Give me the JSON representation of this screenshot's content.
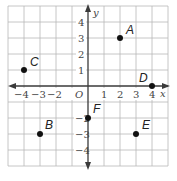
{
  "figure": {
    "type": "coordinate-plane",
    "x_axis": {
      "label": "x",
      "min": -5,
      "max": 5,
      "tick_labels": [
        "-4",
        "-3",
        "-2",
        "1",
        "2",
        "3",
        "4"
      ]
    },
    "y_axis": {
      "label": "y",
      "min": -5,
      "max": 5,
      "tick_labels": [
        "4",
        "3",
        "2",
        "1",
        "-2",
        "-3",
        "-4"
      ]
    },
    "origin_label": "O",
    "grid": true,
    "colors": {
      "grid": "#b8b8b8",
      "axis": "#3a3a3a",
      "point": "#111111"
    }
  },
  "points": [
    {
      "name": "A",
      "x": 2,
      "y": 3
    },
    {
      "name": "B",
      "x": -3,
      "y": -3
    },
    {
      "name": "C",
      "x": -4,
      "y": 1
    },
    {
      "name": "D",
      "x": 4,
      "y": 0
    },
    {
      "name": "E",
      "x": 3,
      "y": -3
    },
    {
      "name": "F",
      "x": 0,
      "y": -2
    }
  ],
  "labels": {
    "x_ticks": {
      "n4": "−4",
      "n3": "−3",
      "n2": "−2",
      "p1": "1",
      "p2": "2",
      "p3": "3",
      "p4": "4"
    },
    "y_ticks": {
      "p4": "4",
      "p3": "3",
      "p2": "2",
      "p1": "1",
      "n2": "−2",
      "n3": "−3",
      "n4": "−4"
    }
  }
}
